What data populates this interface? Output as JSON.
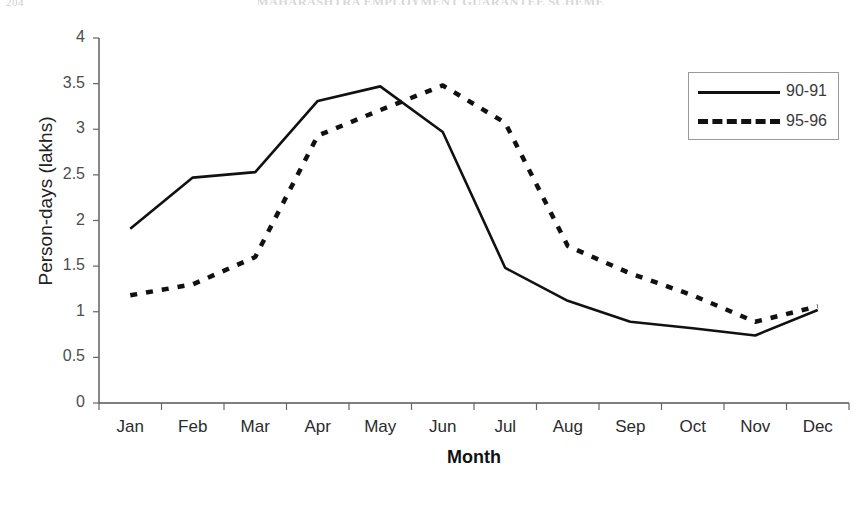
{
  "page": {
    "page_number": "204",
    "figure_title": "MAHARASHTRA EMPLOYMENT GUARANTEE SCHEME"
  },
  "legend": {
    "position": "top-right",
    "entries": [
      {
        "label": "90-91",
        "style": "solid"
      },
      {
        "label": "95-96",
        "style": "dashed"
      }
    ]
  },
  "axes": {
    "y_title": "Person-days (lakhs)",
    "x_title": "Month",
    "y_ticks": [
      "0",
      "0.5",
      "1",
      "1.5",
      "2",
      "2.5",
      "3",
      "3.5",
      "4"
    ],
    "x_ticks": [
      "Jan",
      "Feb",
      "Mar",
      "Apr",
      "May",
      "Jun",
      "Jul",
      "Aug",
      "Sep",
      "Oct",
      "Nov",
      "Dec"
    ]
  },
  "chart_data": {
    "type": "line",
    "title": "MAHARASHTRA EMPLOYMENT GUARANTEE SCHEME",
    "xlabel": "Month",
    "ylabel": "Person-days (lakhs)",
    "ylim": [
      0,
      4
    ],
    "ytick_step": 0.5,
    "grid": false,
    "legend_position": "top-right",
    "categories": [
      "Jan",
      "Feb",
      "Mar",
      "Apr",
      "May",
      "Jun",
      "Jul",
      "Aug",
      "Sep",
      "Oct",
      "Nov",
      "Dec"
    ],
    "series": [
      {
        "name": "90-91",
        "style": "solid",
        "color": "#111111",
        "values": [
          1.91,
          2.47,
          2.53,
          3.31,
          3.47,
          2.97,
          1.48,
          1.12,
          0.89,
          0.82,
          0.74,
          1.02
        ]
      },
      {
        "name": "95-96",
        "style": "dashed",
        "color": "#111111",
        "values": [
          1.18,
          1.3,
          1.6,
          2.93,
          3.21,
          3.48,
          3.07,
          1.72,
          1.42,
          1.18,
          0.89,
          1.06
        ]
      }
    ]
  }
}
